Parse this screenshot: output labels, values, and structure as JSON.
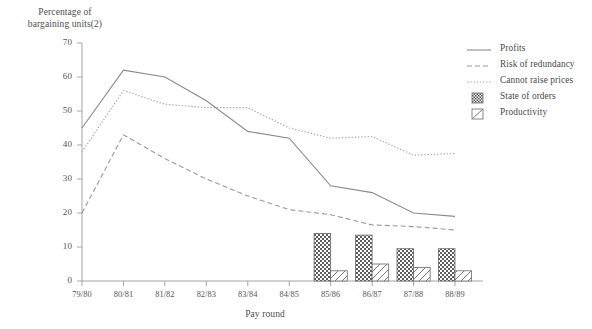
{
  "chart_data": {
    "type": "line",
    "title": "",
    "ylabel": "Percentage of\nbargaining units(2)",
    "xlabel": "Pay round",
    "categories": [
      "79/80",
      "80/81",
      "81/82",
      "82/83",
      "83/84",
      "84/85",
      "85/86",
      "86/87",
      "87/88",
      "88/89"
    ],
    "ylim": [
      0,
      70
    ],
    "yticks": [
      0,
      10,
      20,
      30,
      40,
      50,
      60,
      70
    ],
    "grid": false,
    "legend_position": "right",
    "series": [
      {
        "name": "Profits",
        "style": "solid-line",
        "color": "#8a8a8a",
        "values": [
          45,
          62,
          60,
          53,
          44,
          42,
          28,
          26,
          20,
          19
        ]
      },
      {
        "name": "Risk of redundancy",
        "style": "dashed-line",
        "color": "#9a9a9a",
        "values": [
          20,
          43,
          36,
          30,
          25,
          21,
          19.5,
          16.5,
          16,
          15
        ]
      },
      {
        "name": "Cannot raise prices",
        "style": "dotted-line",
        "color": "#a5a5a5",
        "values": [
          38,
          56,
          52,
          51,
          51,
          45,
          42,
          42.5,
          37,
          37.5
        ]
      },
      {
        "name": "State of orders",
        "style": "checkerboard-bar",
        "color": "#6b6b6b",
        "values": [
          null,
          null,
          null,
          null,
          null,
          null,
          14,
          13.5,
          9.5,
          9.5
        ]
      },
      {
        "name": "Productivity",
        "style": "diagonal-hatch-bar",
        "color": "#8c8c8c",
        "values": [
          null,
          null,
          null,
          null,
          null,
          null,
          3,
          5,
          4,
          3
        ]
      }
    ]
  },
  "legend": {
    "items": [
      {
        "label": "Profits",
        "swatch": "solid-line-swatch"
      },
      {
        "label": "Risk of redundancy",
        "swatch": "dashed-line-swatch"
      },
      {
        "label": "Cannot raise prices",
        "swatch": "dotted-line-swatch"
      },
      {
        "label": "State of orders",
        "swatch": "checkerboard-swatch"
      },
      {
        "label": "Productivity",
        "swatch": "diagonal-hatch-swatch"
      }
    ]
  },
  "axes": {
    "y_title": "Percentage of\nbargaining units(2)",
    "x_title": "Pay round",
    "y_tick_labels": [
      "0",
      "10",
      "20",
      "30",
      "40",
      "50",
      "60",
      "70"
    ],
    "x_tick_labels": [
      "79/80",
      "80/81",
      "81/82",
      "82/83",
      "83/84",
      "84/85",
      "85/86",
      "86/87",
      "87/88",
      "88/89"
    ]
  }
}
